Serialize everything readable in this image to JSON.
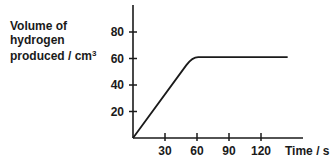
{
  "chart_data": {
    "type": "line",
    "title": "",
    "ylabel_lines": [
      "Volume of",
      "hydrogen",
      "produced / cm"
    ],
    "ylabel_superscript": "3",
    "xlabel": "Time / s",
    "x_ticks": [
      30,
      60,
      90,
      120
    ],
    "y_ticks": [
      20,
      40,
      60,
      80
    ],
    "xlim": [
      0,
      160
    ],
    "ylim": [
      0,
      100
    ],
    "grid": false,
    "series": [
      {
        "name": "Volume of hydrogen",
        "x": [
          0,
          10,
          20,
          30,
          40,
          50,
          55,
          60,
          70,
          90,
          120,
          145
        ],
        "y": [
          0,
          11,
          22,
          33,
          44,
          55,
          59,
          61,
          61,
          61,
          61,
          61
        ]
      }
    ]
  }
}
